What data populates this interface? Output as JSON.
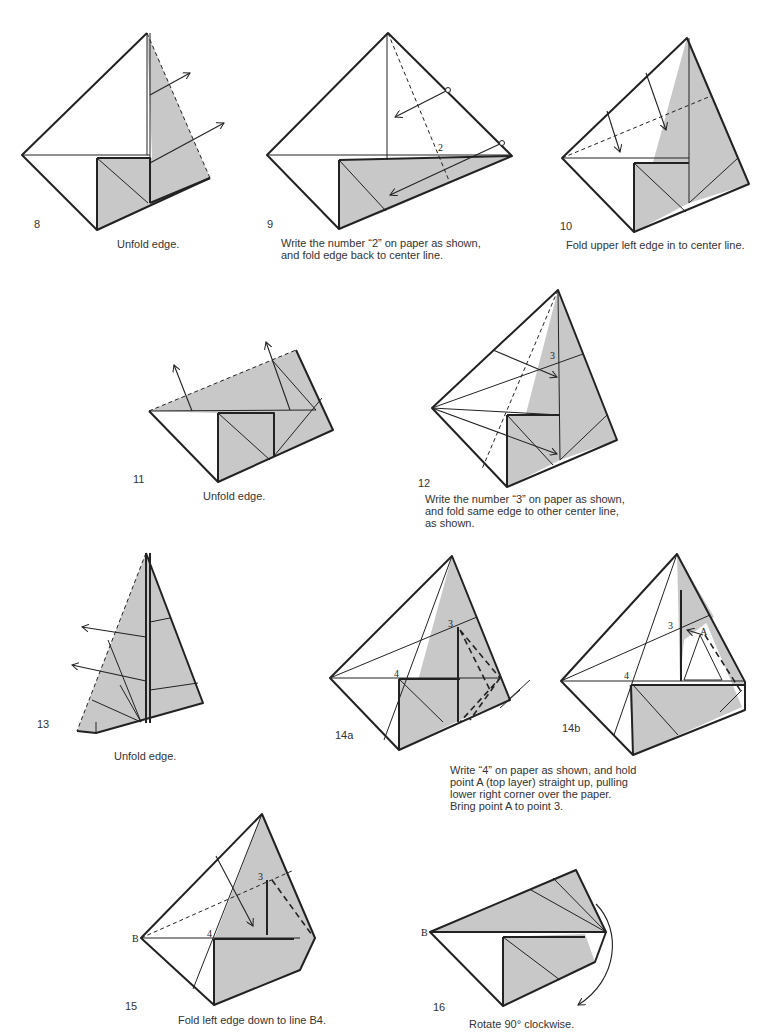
{
  "steps": [
    {
      "number": "8",
      "caption": "Unfold edge."
    },
    {
      "number": "9",
      "caption": "Write the number “2” on paper as shown,\nand fold edge back to center line.",
      "marker": "2"
    },
    {
      "number": "10",
      "caption": "Fold upper left edge in to center line."
    },
    {
      "number": "11",
      "caption": "Unfold edge."
    },
    {
      "number": "12",
      "caption": "Write the number “3” on paper as shown,\nand fold same edge to other center line,\nas shown.",
      "marker": "3"
    },
    {
      "number": "13",
      "caption": "Unfold edge."
    },
    {
      "number": "14a",
      "caption": "Write “4” on paper as shown, and hold\npoint A (top layer) straight up, pulling\nlower right corner over the paper.\nBring point A to point 3.",
      "markers": [
        "3",
        "4",
        "A"
      ]
    },
    {
      "number": "14b",
      "markers": [
        "3",
        "4",
        "A"
      ]
    },
    {
      "number": "15",
      "caption": "Fold left edge down to line B4.",
      "markers": [
        "B",
        "3",
        "4"
      ]
    },
    {
      "number": "16",
      "caption": "Rotate 90° clockwise.",
      "markers": [
        "B"
      ]
    }
  ],
  "colors": {
    "paper_shade": "#c8c8c8",
    "line": "#222222",
    "background": "#ffffff"
  }
}
